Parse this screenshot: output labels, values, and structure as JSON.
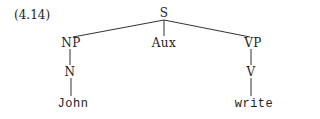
{
  "example_number": "(4.14)",
  "tree": {
    "root": "S",
    "children": [
      {
        "label": "NP",
        "children": [
          {
            "label": "N",
            "children": [
              {
                "label": "John"
              }
            ]
          }
        ]
      },
      {
        "label": "Aux"
      },
      {
        "label": "VP",
        "children": [
          {
            "label": "V",
            "children": [
              {
                "label": "write"
              }
            ]
          }
        ]
      }
    ]
  },
  "nodes": {
    "s": "S",
    "np": "NP",
    "aux": "Aux",
    "vp": "VP",
    "n": "N",
    "v": "V",
    "john": "John",
    "write": "write"
  }
}
